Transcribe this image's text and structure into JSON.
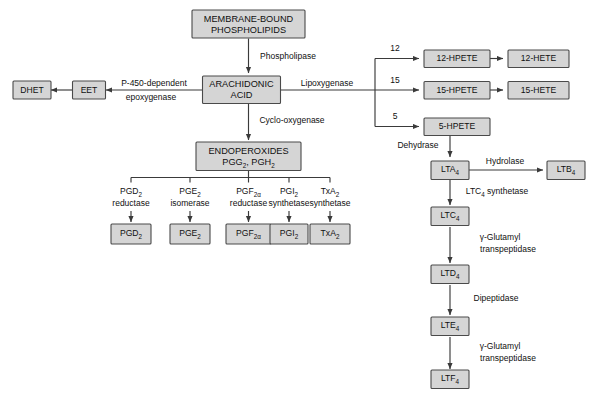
{
  "diagram": {
    "colors": {
      "box_fill": "#d5d5d5",
      "box_stroke": "#4a4a4a",
      "line": "#3a3a3a",
      "text": "#101010",
      "background": "#ffffff"
    }
  },
  "nodes": {
    "membrane_phospholipids": {
      "line1": "MEMBRANE-BOUND",
      "line2": "PHOSPHOLIPIDS"
    },
    "arachidonic_acid": {
      "line1": "ARACHIDONIC",
      "line2": "ACID"
    },
    "endoperoxides": {
      "line1": "ENDOPEROXIDES",
      "line2_a": "PGG",
      "line2_a_sub": "2",
      "line2_sep": ",",
      "line2_b": "PGH",
      "line2_b_sub": "2"
    },
    "dhet": {
      "label": "DHET"
    },
    "eet": {
      "label": "EET"
    },
    "pgd2": {
      "label": "PGD",
      "sub": "2"
    },
    "pge2": {
      "label": "PGE",
      "sub": "2"
    },
    "pgf2a": {
      "label": "PGF",
      "sub": "2α"
    },
    "pgi2": {
      "label": "PGI",
      "sub": "2"
    },
    "txa2": {
      "label": "TxA",
      "sub": "2"
    },
    "hpete_12": {
      "label": "12-HPETE"
    },
    "hete_12": {
      "label": "12-HETE"
    },
    "hpete_15": {
      "label": "15-HPETE"
    },
    "hete_15": {
      "label": "15-HETE"
    },
    "hpete_5": {
      "label": "5-HPETE"
    },
    "lta4": {
      "label": "LTA",
      "sub": "4"
    },
    "ltb4": {
      "label": "LTB",
      "sub": "4"
    },
    "ltc4": {
      "label": "LTC",
      "sub": "4"
    },
    "ltd4": {
      "label": "LTD",
      "sub": "4"
    },
    "lte4": {
      "label": "LTE",
      "sub": "4"
    },
    "ltf4": {
      "label": "LTF",
      "sub": "4"
    }
  },
  "enzymes": {
    "phospholipase": {
      "label": "Phospholipase"
    },
    "cyclo_oxygenase": {
      "label": "Cyclo-oxygenase"
    },
    "lipoxygenase": {
      "label": "Lipoxygenase"
    },
    "epoxygenase": {
      "line1": "P-450-dependent",
      "line2": "epoxygenase"
    },
    "pgd2_reductase": {
      "line1": "PGD",
      "line1_sub": "2",
      "line2": "reductase"
    },
    "pge2_isomerase": {
      "line1": "PGE",
      "line1_sub": "2",
      "line2": "isomerase"
    },
    "pgf2a_reductase": {
      "line1": "PGF",
      "line1_sub": "2α",
      "line2": "reductase"
    },
    "pgi2_synthetase": {
      "line1": "PGI",
      "line1_sub": "2",
      "line2": "synthetase"
    },
    "txa2_synthetase": {
      "line1": "TxA",
      "line1_sub": "2",
      "line2": "synthetase"
    },
    "dehydrase": {
      "label": "Dehydrase"
    },
    "hydrolase": {
      "label": "Hydrolase"
    },
    "ltc4_synthetase": {
      "label": "LTC",
      "sub": "4",
      "label2": " synthetase"
    },
    "glutamyl_transpeptidase_1": {
      "line1": "γ-Glutamyl",
      "line2": "transpeptidase"
    },
    "dipeptidase": {
      "label": "Dipeptidase"
    },
    "glutamyl_transpeptidase_2": {
      "line1": "γ-Glutamyl",
      "line2": "transpeptidase"
    }
  },
  "branch_numbers": {
    "lipox_12": "12",
    "lipox_15": "15",
    "lipox_5": "5"
  }
}
